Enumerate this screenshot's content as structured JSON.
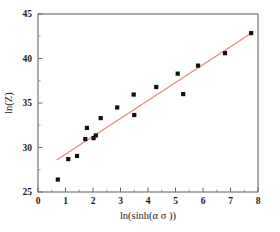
{
  "chart_data": {
    "type": "scatter",
    "title": "",
    "xlabel": "ln(sinh(α σ ))",
    "ylabel": "ln(Z)",
    "xlim": [
      0,
      8
    ],
    "ylim": [
      25,
      45
    ],
    "grid": false,
    "legend": null,
    "xticks": [
      0,
      1,
      2,
      3,
      4,
      5,
      6,
      7,
      8
    ],
    "xtick_labels": [
      "0",
      "1",
      "2",
      "3",
      "4",
      "5",
      "6",
      "7",
      "8"
    ],
    "xminor_ticks": [
      0.5,
      1.5,
      2.5,
      3.5,
      4.5,
      5.5,
      6.5,
      7.5
    ],
    "yticks": [
      25,
      30,
      35,
      40,
      45
    ],
    "ytick_labels": [
      "25",
      "30",
      "35",
      "40",
      "45"
    ],
    "yminor_ticks": [
      27.5,
      32.5,
      37.5,
      42.5
    ],
    "marker_style": "filled-square",
    "marker_color": "#111111",
    "marker_size": 4.2,
    "points": [
      {
        "x": 0.72,
        "y": 26.4
      },
      {
        "x": 1.1,
        "y": 28.7
      },
      {
        "x": 1.42,
        "y": 29.05
      },
      {
        "x": 1.72,
        "y": 30.95
      },
      {
        "x": 1.78,
        "y": 32.2
      },
      {
        "x": 2.02,
        "y": 31.05
      },
      {
        "x": 2.1,
        "y": 31.35
      },
      {
        "x": 2.28,
        "y": 33.3
      },
      {
        "x": 2.88,
        "y": 34.5
      },
      {
        "x": 3.48,
        "y": 35.95
      },
      {
        "x": 3.5,
        "y": 33.65
      },
      {
        "x": 4.3,
        "y": 36.8
      },
      {
        "x": 5.08,
        "y": 38.3
      },
      {
        "x": 5.28,
        "y": 36.0
      },
      {
        "x": 5.82,
        "y": 39.2
      },
      {
        "x": 6.8,
        "y": 40.6
      },
      {
        "x": 7.75,
        "y": 42.85
      }
    ],
    "fit_line": {
      "type": "line",
      "color": "#e8897a",
      "x_start": 0.68,
      "y_start": 28.6,
      "x_end": 7.78,
      "y_end": 42.9
    },
    "series": [
      {
        "name": "ln(Z) data",
        "x": [
          0.72,
          1.1,
          1.42,
          1.72,
          1.78,
          2.02,
          2.1,
          2.28,
          2.88,
          3.48,
          3.5,
          4.3,
          5.08,
          5.28,
          5.82,
          6.8,
          7.75
        ],
        "values": [
          26.4,
          28.7,
          29.05,
          30.95,
          32.2,
          31.05,
          31.35,
          33.3,
          34.5,
          35.95,
          33.65,
          36.8,
          38.3,
          36.0,
          39.2,
          40.6,
          42.85
        ]
      }
    ]
  },
  "axis_colors": {
    "frame": "#6a6a6a",
    "text": "#1a1a1a",
    "fit_line": "#e8897a",
    "marker": "#111111"
  }
}
